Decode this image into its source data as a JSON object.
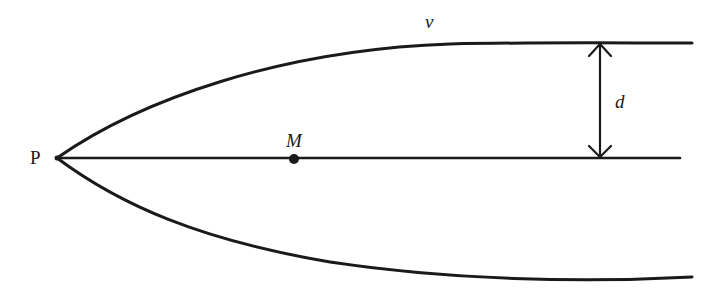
{
  "diagram": {
    "type": "flow-boundary-diagram",
    "labels": {
      "vertex": "P",
      "point_on_axis": "M",
      "upper_curve": "v",
      "distance": "d"
    },
    "elements": {
      "vertex_P": {
        "x": 57,
        "y": 158
      },
      "point_M": {
        "x": 294,
        "y": 159
      },
      "axis": {
        "x1": 57,
        "y1": 158,
        "x2": 680,
        "y2": 158
      },
      "upper_curve_end": {
        "x": 692,
        "y": 43
      },
      "lower_curve_end": {
        "x": 692,
        "y": 277
      },
      "dimension_arrow": {
        "x": 600,
        "y_top": 43,
        "y_bottom": 158
      }
    },
    "colors": {
      "stroke": "#1a1a1a",
      "background": "#ffffff"
    }
  }
}
